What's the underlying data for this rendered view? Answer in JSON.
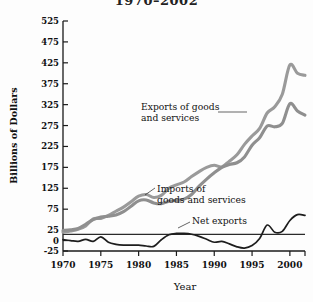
{
  "chart_data": {
    "type": "line",
    "title": "1970–2002",
    "xlabel": "Year",
    "ylabel": "Billions of Dollars",
    "xlim": [
      1970,
      2002
    ],
    "ylim": [
      -25,
      525
    ],
    "ytick_labels": [
      "525",
      "475",
      "425",
      "375",
      "325",
      "275",
      "225",
      "175",
      "125",
      "75",
      "25",
      "0",
      "-25"
    ],
    "ytick_values": [
      525,
      475,
      425,
      375,
      325,
      275,
      225,
      175,
      125,
      75,
      25,
      0,
      -25
    ],
    "xtick_labels": [
      "1970",
      "1975",
      "1980",
      "1985",
      "1990",
      "1995",
      "2000"
    ],
    "xtick_values": [
      1970,
      1975,
      1980,
      1985,
      1990,
      1995,
      2000
    ],
    "grid": false,
    "legend_position": "inline-annotations",
    "zero_line": true,
    "x": [
      1970,
      1971,
      1972,
      1973,
      1974,
      1975,
      1976,
      1977,
      1978,
      1979,
      1980,
      1981,
      1982,
      1983,
      1984,
      1985,
      1986,
      1987,
      1988,
      1989,
      1990,
      1991,
      1992,
      1993,
      1994,
      1995,
      1996,
      1997,
      1998,
      1999,
      2000,
      2001,
      2002
    ],
    "series": [
      {
        "name": "Exports of goods and services",
        "color": "#8f8f8f",
        "values": [
          24,
          26,
          29,
          39,
          50,
          56,
          58,
          61,
          69,
          82,
          95,
          97,
          90,
          88,
          94,
          96,
          99,
          110,
          130,
          147,
          162,
          175,
          182,
          186,
          200,
          228,
          246,
          274,
          272,
          280,
          327,
          310,
          300
        ]
      },
      {
        "name": "Imports of goods and services",
        "color": "#9a9a9a",
        "values": [
          20,
          23,
          27,
          35,
          52,
          53,
          60,
          70,
          80,
          93,
          106,
          110,
          103,
          108,
          125,
          133,
          140,
          153,
          165,
          175,
          180,
          176,
          190,
          205,
          230,
          250,
          268,
          305,
          320,
          350,
          420,
          400,
          395
        ]
      },
      {
        "name": "Net exports",
        "color": "#1d1d1d",
        "values": [
          2,
          0,
          -2,
          3,
          -2,
          9,
          -4,
          -9,
          -11,
          -11,
          -11,
          -13,
          -14,
          2,
          14,
          17,
          17,
          15,
          10,
          3,
          -4,
          -2,
          -8,
          -15,
          -18,
          -12,
          5,
          37,
          20,
          22,
          48,
          62,
          60
        ]
      }
    ],
    "annotations": [
      {
        "name": "exports-label",
        "line1": "Exports of goods",
        "line2": "and services"
      },
      {
        "name": "imports-label",
        "line1": "Imports of",
        "line2": "goods and services"
      },
      {
        "name": "net-exports-label",
        "line1": "Net exports",
        "line2": ""
      }
    ]
  }
}
